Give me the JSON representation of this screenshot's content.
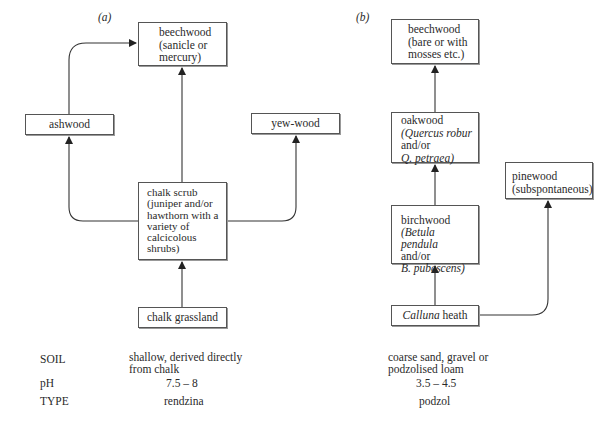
{
  "panel_a": {
    "label": "(a)",
    "nodes": {
      "beechwood": {
        "line1": "beechwood",
        "line2": "(sanicle or",
        "line3": "mercury)"
      },
      "ashwood": {
        "text": "ashwood"
      },
      "yewwood": {
        "text": "yew-wood"
      },
      "chalk_scrub": {
        "line1": "chalk scrub",
        "line2": "(juniper and/or",
        "line3": "hawthorn with a",
        "line4": "variety of",
        "line5": "calcicolous",
        "line6": "shrubs)"
      },
      "chalk_grassland": {
        "text": "chalk grassland"
      }
    },
    "soil": {
      "line1": "shallow, derived directly",
      "line2": "from chalk"
    },
    "ph": "7.5 – 8",
    "type": "rendzina"
  },
  "panel_b": {
    "label": "(b)",
    "nodes": {
      "beechwood": {
        "line1": "beechwood",
        "line2": "(bare or with",
        "line3": "mosses etc.)"
      },
      "oakwood": {
        "line1": "oakwood",
        "line2": "(Quercus robur",
        "line3": "and/or",
        "line4": "Q. petraea)"
      },
      "pinewood": {
        "line1": "pinewood",
        "line2": "(subspontaneous)"
      },
      "birchwood": {
        "line1": "birchwood",
        "line2": "(Betula pendula",
        "line3": "and/or",
        "line4": "B. pubescens)"
      },
      "calluna": {
        "italic": "Calluna",
        "rest": " heath"
      }
    },
    "soil": {
      "line1": "coarse sand, gravel or",
      "line2": "podzolised loam"
    },
    "ph": "3.5 – 4.5",
    "type": "podzol"
  },
  "row_labels": {
    "soil": "SOIL",
    "ph": "pH",
    "type": "TYPE"
  }
}
